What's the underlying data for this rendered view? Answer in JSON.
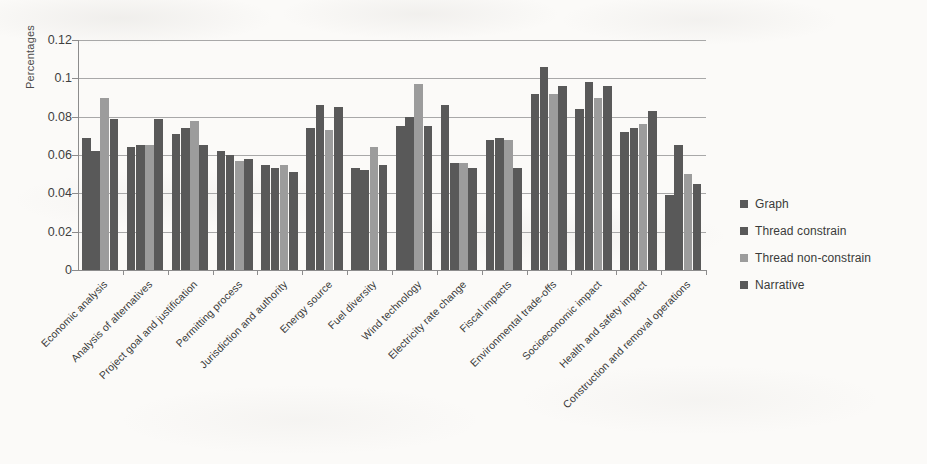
{
  "chart_data": {
    "type": "bar",
    "title": "",
    "xlabel": "",
    "ylabel": "Percentages",
    "ylim": [
      0,
      0.12
    ],
    "ytick_values": [
      0,
      0.02,
      0.04,
      0.06,
      0.08,
      0.1,
      0.12
    ],
    "ytick_labels": [
      "0",
      "0.02",
      "0.04",
      "0.06",
      "0.08",
      "0.1",
      "0.12"
    ],
    "grid": "horizontal",
    "legend_position": "right",
    "categories": [
      "Economic analysis",
      "Analysis of alternatives",
      "Project goal and justification",
      "Permitting process",
      "Jurisdiction and authority",
      "Energy source",
      "Fuel diversity",
      "Wind technology",
      "Electricity rate change",
      "Fiscal impacts",
      "Environmental trade-offs",
      "Socioeconomic impact",
      "Health and safety impact",
      "Construction and removal operations"
    ],
    "series": [
      {
        "name": "Graph",
        "color": "#595959",
        "values": [
          0.069,
          0.064,
          0.071,
          0.062,
          0.055,
          0.074,
          0.053,
          0.075,
          0.086,
          0.068,
          0.092,
          0.084,
          0.072,
          0.039
        ]
      },
      {
        "name": "Thread constrain",
        "color": "#595959",
        "values": [
          0.062,
          0.065,
          0.074,
          0.06,
          0.053,
          0.086,
          0.052,
          0.08,
          0.056,
          0.069,
          0.106,
          0.098,
          0.074,
          0.065
        ]
      },
      {
        "name": "Thread non-constrain",
        "color": "#9c9c9c",
        "values": [
          0.09,
          0.065,
          0.078,
          0.057,
          0.055,
          0.073,
          0.064,
          0.097,
          0.056,
          0.068,
          0.092,
          0.09,
          0.076,
          0.05
        ]
      },
      {
        "name": "Narrative",
        "color": "#595959",
        "values": [
          0.079,
          0.079,
          0.065,
          0.058,
          0.051,
          0.085,
          0.055,
          0.075,
          0.053,
          0.053,
          0.096,
          0.096,
          0.083,
          0.045
        ]
      }
    ]
  },
  "legend": {
    "items": [
      {
        "label": "Graph",
        "color": "#595959"
      },
      {
        "label": "Thread constrain",
        "color": "#595959"
      },
      {
        "label": "Thread non-constrain",
        "color": "#9c9c9c"
      },
      {
        "label": "Narrative",
        "color": "#595959"
      }
    ]
  }
}
